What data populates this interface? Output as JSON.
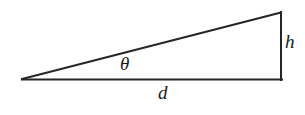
{
  "figure": {
    "kind": "geometry-diagram",
    "shape": "right-triangle",
    "background_color": "#ffffff",
    "stroke_color": "#262626",
    "stroke_width": 2
  },
  "labels": {
    "angle": "θ",
    "base": "d",
    "height": "h"
  },
  "geometry": {
    "vertices": {
      "left": {
        "x": 22,
        "y": 79
      },
      "apex": {
        "x": 281,
        "y": 12
      },
      "corner": {
        "x": 281,
        "y": 79
      }
    },
    "edges": [
      {
        "name": "hypotenuse",
        "from": "left",
        "to": "apex"
      },
      {
        "name": "base",
        "from": "left",
        "to": "corner",
        "label": "d"
      },
      {
        "name": "height",
        "from": "corner",
        "to": "apex",
        "label": "h"
      }
    ],
    "angle_marker": {
      "at": "left",
      "label": "θ",
      "label_x": 128,
      "label_y": 66
    }
  }
}
